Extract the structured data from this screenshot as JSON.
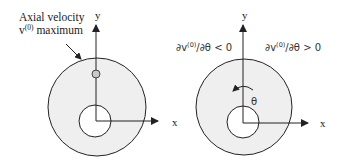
{
  "colors": {
    "ring_fill": "#efefef",
    "stroke": "#222222",
    "marker_fill": "#c8c8c8",
    "background": "#ffffff"
  },
  "left_panel": {
    "annotation_line1": "Axial velocity",
    "annotation_line2_prefix": "v",
    "annotation_line2_superscript": "(0)",
    "annotation_line2_suffix": " maximum",
    "y_axis_label": "y",
    "x_axis_label": "x"
  },
  "right_panel": {
    "left_region_label": {
      "prefix": "∂v",
      "superscript": "(0)",
      "suffix": "/∂θ < 0"
    },
    "right_region_label": {
      "prefix": "∂v",
      "superscript": "(0)",
      "suffix": "/∂θ > 0"
    },
    "angle_label": "θ",
    "y_axis_label": "y",
    "x_axis_label": "x"
  }
}
